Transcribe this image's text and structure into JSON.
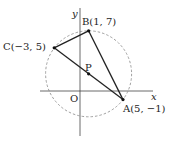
{
  "diagram": {
    "type": "coordinate-geometry",
    "axes": {
      "x_label": "x",
      "y_label": "y",
      "origin_label": "O"
    },
    "points": [
      {
        "name": "A",
        "label": "A(5, −1)",
        "x": 5,
        "y": -1
      },
      {
        "name": "B",
        "label": "B(1, 7)",
        "x": 1,
        "y": 7
      },
      {
        "name": "C",
        "label": "C(−3, 5)",
        "x": -3,
        "y": 5
      },
      {
        "name": "P",
        "label": "P",
        "x": 1,
        "y": 2
      }
    ],
    "triangle": [
      "A",
      "B",
      "C"
    ],
    "segments": [
      [
        "A",
        "B"
      ],
      [
        "B",
        "C"
      ],
      [
        "C",
        "A"
      ]
    ],
    "circle": {
      "center": "P",
      "radius": 5,
      "style": "dashed"
    }
  }
}
